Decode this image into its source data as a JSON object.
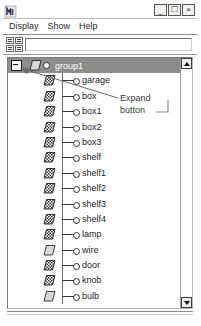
{
  "window": {
    "title": "",
    "icon": "app-logo-icon",
    "controls": {
      "minimize": "_",
      "maximize": "□",
      "close": "×"
    }
  },
  "menu": {
    "items": [
      {
        "label": "Display"
      },
      {
        "label": "Show"
      },
      {
        "label": "Help"
      }
    ]
  },
  "toolbar": {
    "input_value": "",
    "input_placeholder": "",
    "grid_icon": "node-grid-icon"
  },
  "tree": {
    "root": {
      "label": "group1",
      "icon": "plain-parallelogram-icon",
      "expanded": true,
      "expand_glyph": "−",
      "selected": true
    },
    "items": [
      {
        "label": "garage",
        "icon": "hatched-parallelogram-icon"
      },
      {
        "label": "box",
        "icon": "hatched-parallelogram-icon"
      },
      {
        "label": "box1",
        "icon": "hatched-parallelogram-icon"
      },
      {
        "label": "box2",
        "icon": "hatched-parallelogram-icon"
      },
      {
        "label": "box3",
        "icon": "hatched-parallelogram-icon"
      },
      {
        "label": "shelf",
        "icon": "hatched-parallelogram-icon"
      },
      {
        "label": "shelf1",
        "icon": "hatched-parallelogram-icon"
      },
      {
        "label": "shelf2",
        "icon": "hatched-parallelogram-icon"
      },
      {
        "label": "shelf3",
        "icon": "hatched-parallelogram-icon"
      },
      {
        "label": "shelf4",
        "icon": "hatched-parallelogram-icon"
      },
      {
        "label": "lamp",
        "icon": "hatched-parallelogram-icon"
      },
      {
        "label": "wire",
        "icon": "plain-parallelogram-icon"
      },
      {
        "label": "door",
        "icon": "hatched-parallelogram-icon"
      },
      {
        "label": "knob",
        "icon": "hatched-parallelogram-icon"
      },
      {
        "label": "bulb",
        "icon": "plain-parallelogram-icon"
      }
    ],
    "scrollbar": {
      "up_arrow": "▲",
      "down_arrow": "▼"
    }
  },
  "annotation": {
    "line1": "Expand",
    "line2": "button"
  },
  "colors": {
    "selection_bg": "#8d8d8d",
    "selection_text": "#ffffff",
    "window_bg": "#ffffff",
    "border": "#7a7a7a",
    "text": "#1c1c1c",
    "annotation_text": "#3a3a3a"
  }
}
